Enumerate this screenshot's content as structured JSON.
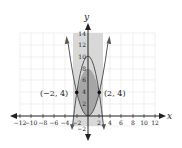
{
  "graph": {
    "x_axis_label": "x",
    "y_axis_label": "y",
    "x_ticks": [
      "−12",
      "−10",
      "−8",
      "−6",
      "−4",
      "−2",
      "2",
      "4",
      "6",
      "8",
      "10",
      "12"
    ],
    "y_ticks": [
      "2",
      "4",
      "6",
      "8",
      "10",
      "12",
      "14"
    ],
    "y_neg_tick": "−2",
    "points": [
      {
        "label": "(−2, 4)",
        "x": -2,
        "y": 4
      },
      {
        "label": "(2, 4)",
        "x": 2,
        "y": 4
      }
    ],
    "curves": [
      {
        "name": "upward-parabola",
        "equation": "y = x²"
      },
      {
        "name": "downward-parabola",
        "equation": "y = 12 − 2x²"
      }
    ],
    "colors": {
      "shade_light": "#d4d4d4",
      "shade_dark": "#9a9a9a",
      "curve": "#555555",
      "grid": "#e3e3e3"
    }
  }
}
